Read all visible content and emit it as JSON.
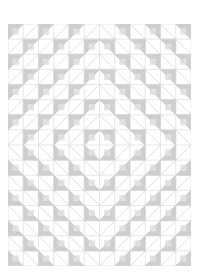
{
  "diagram": {
    "type": "quilt-pattern",
    "grid": {
      "cols": 12,
      "rows": 16,
      "cell_px": 15.2
    },
    "center": {
      "col": 6,
      "row": 8
    },
    "colors": {
      "background": "#ffffff",
      "grid_line": "#d6d6d6",
      "diagonal_line": "#c8c8c8",
      "shaded_fill": "#cfcfcf",
      "shaded_stroke": "#b8b8b8"
    },
    "ring_period": 2
  }
}
